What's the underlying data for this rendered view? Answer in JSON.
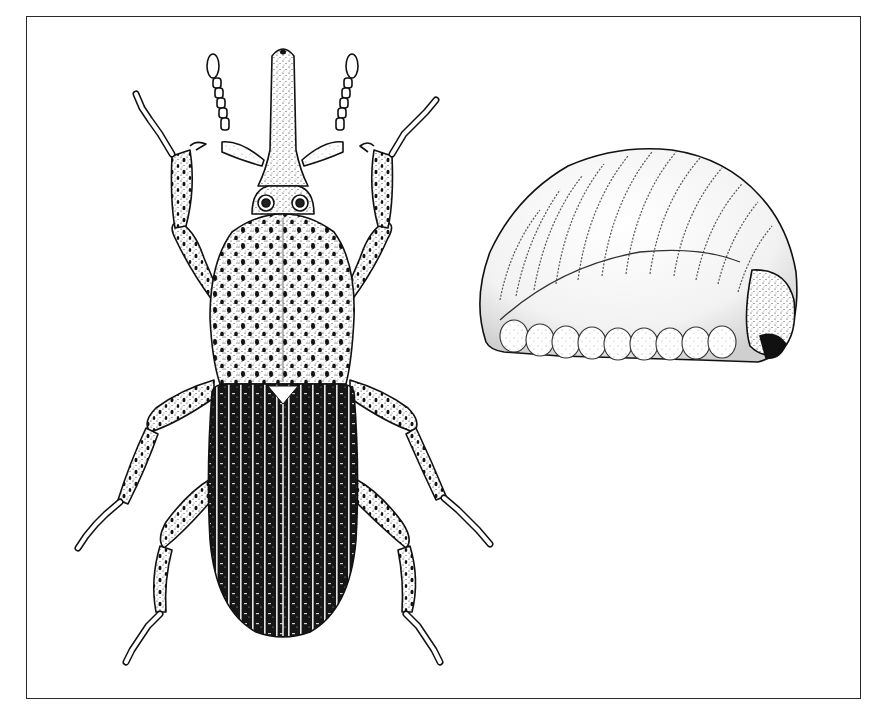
{
  "figure": {
    "background": "#ffffff",
    "ink": "#111111",
    "frame": {
      "x": 26,
      "y": 16,
      "width": 835,
      "height": 683,
      "stroke": "#2a2a2a"
    },
    "subjects": [
      {
        "id": "adult-weevil",
        "view": "dorsal",
        "center_x": 283,
        "top_y": 46,
        "bottom_y": 640
      },
      {
        "id": "larva",
        "view": "lateral-curled",
        "x": 476,
        "y": 148,
        "width": 320,
        "height": 218
      }
    ]
  }
}
